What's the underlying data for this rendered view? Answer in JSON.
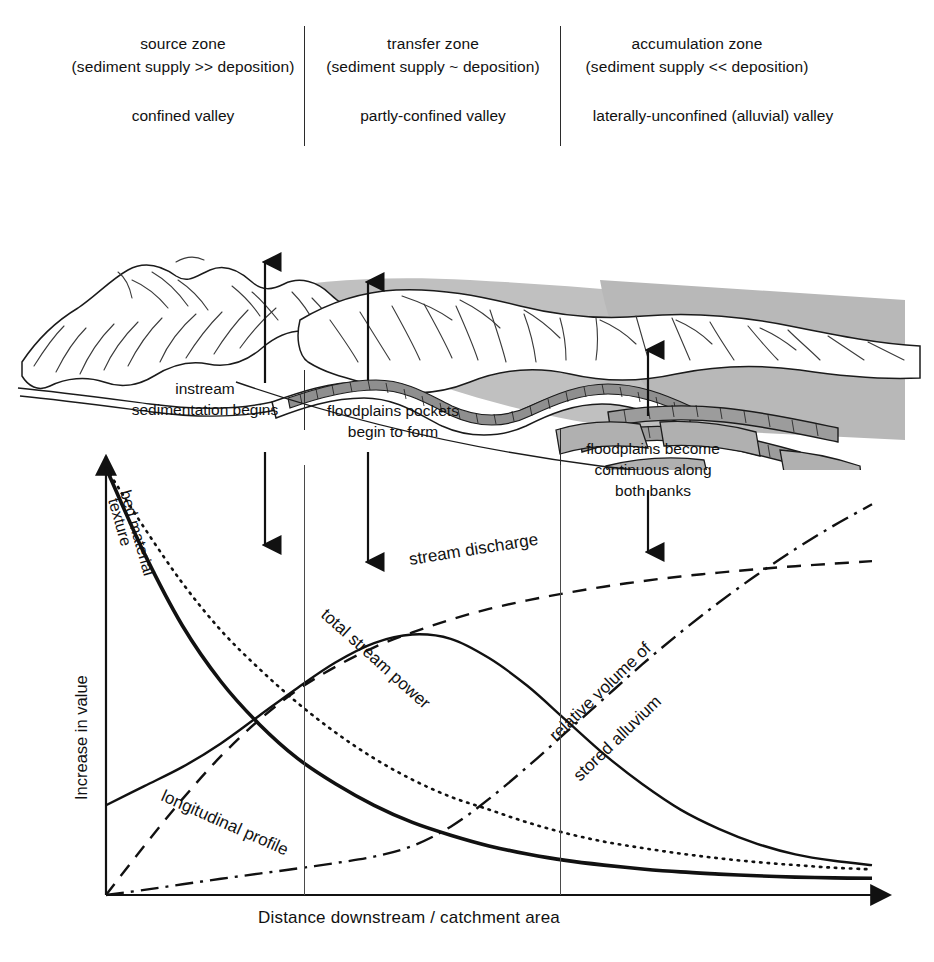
{
  "zones": [
    {
      "id": "source",
      "name": "source zone",
      "relation": "(sediment supply >> deposition)",
      "valley": "confined valley"
    },
    {
      "id": "transfer",
      "name": "transfer zone",
      "relation": "(sediment supply ~ deposition)",
      "valley": "partly-confined valley"
    },
    {
      "id": "accumulation",
      "name": "accumulation zone",
      "relation": "(sediment supply << deposition)",
      "valley": "laterally-unconfined (alluvial) valley"
    }
  ],
  "annotations": [
    {
      "id": "instream",
      "lines": [
        "instream",
        "sedimentation begins"
      ]
    },
    {
      "id": "pockets",
      "lines": [
        "floodplains pockets",
        "begin to form"
      ]
    },
    {
      "id": "continuous",
      "lines": [
        "floodplains become",
        "continuous along",
        "both banks"
      ]
    }
  ],
  "chart_data": {
    "type": "line",
    "title": "",
    "xlabel": "Distance downstream / catchment area",
    "ylabel": "Increase in value",
    "xlim": [
      0,
      1
    ],
    "ylim": [
      0,
      1
    ],
    "grid": false,
    "legend": "inline-curve-labels",
    "x": [
      0,
      0.05,
      0.1,
      0.15,
      0.2,
      0.25,
      0.3,
      0.35,
      0.4,
      0.45,
      0.5,
      0.55,
      0.6,
      0.65,
      0.7,
      0.75,
      0.8,
      0.85,
      0.9,
      0.95,
      1.0
    ],
    "series": [
      {
        "name": "bed material texture",
        "style": "dotted",
        "values": [
          1.0,
          0.86,
          0.73,
          0.62,
          0.53,
          0.45,
          0.38,
          0.32,
          0.27,
          0.23,
          0.2,
          0.17,
          0.145,
          0.125,
          0.11,
          0.097,
          0.086,
          0.077,
          0.07,
          0.064,
          0.06
        ]
      },
      {
        "name": "longitudinal profile",
        "style": "solid-thick",
        "values": [
          1.0,
          0.8,
          0.63,
          0.5,
          0.4,
          0.32,
          0.26,
          0.21,
          0.17,
          0.14,
          0.115,
          0.096,
          0.081,
          0.07,
          0.061,
          0.054,
          0.049,
          0.045,
          0.042,
          0.04,
          0.039
        ]
      },
      {
        "name": "stream discharge",
        "style": "dashed",
        "values": [
          0.0,
          0.115,
          0.225,
          0.325,
          0.41,
          0.48,
          0.535,
          0.58,
          0.615,
          0.645,
          0.67,
          0.69,
          0.707,
          0.722,
          0.735,
          0.746,
          0.755,
          0.763,
          0.77,
          0.776,
          0.782
        ]
      },
      {
        "name": "total stream power",
        "style": "solid",
        "values": [
          0.21,
          0.255,
          0.3,
          0.355,
          0.42,
          0.485,
          0.545,
          0.59,
          0.61,
          0.6,
          0.555,
          0.49,
          0.41,
          0.33,
          0.26,
          0.2,
          0.155,
          0.12,
          0.095,
          0.08,
          0.07
        ]
      },
      {
        "name": "relative volume of stored alluvium",
        "style": "dash-dot",
        "values": [
          0.0,
          0.012,
          0.025,
          0.038,
          0.05,
          0.062,
          0.075,
          0.09,
          0.115,
          0.16,
          0.225,
          0.3,
          0.38,
          0.46,
          0.54,
          0.615,
          0.685,
          0.75,
          0.81,
          0.865,
          0.915
        ]
      }
    ]
  },
  "curve_labels": {
    "bed_material": "bed material",
    "texture": "texture",
    "longitudinal_profile": "longitudinal profile",
    "stream_discharge": "stream discharge",
    "total_stream_power": "total stream power",
    "relative_volume": "relative volume of",
    "stored_alluvium": "stored alluvium"
  },
  "colors": {
    "ink": "#111111",
    "line": "#2b2b2b",
    "shade_light": "#c9c9c9",
    "shade_mid": "#a9a9a9",
    "shade_dark": "#8a8a8a",
    "background": "#ffffff"
  }
}
